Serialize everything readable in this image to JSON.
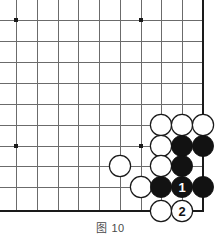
{
  "figure": {
    "caption": "图 10",
    "type": "go-board-diagram"
  },
  "board": {
    "line_color": "#6b6b6b",
    "edge_color": "#1a1a1a",
    "background": "#ffffff",
    "black_stone_color": "#121212",
    "white_stone_color": "#ffffff",
    "white_stone_border": "#1a1a1a",
    "grid_spacing": 20.7,
    "columns_x": [
      16,
      37,
      58,
      78,
      99,
      120,
      141,
      161,
      182,
      203
    ],
    "rows_y": [
      20,
      41,
      62,
      83,
      104,
      125,
      146,
      166,
      187,
      211
    ],
    "edges": {
      "right_x": 203,
      "bottom_y": 211
    },
    "star_points": [
      {
        "x": 16,
        "y": 20
      },
      {
        "x": 141,
        "y": 20
      },
      {
        "x": 16,
        "y": 146
      },
      {
        "x": 141,
        "y": 146
      }
    ],
    "stones": [
      {
        "color": "white",
        "x": 161,
        "y": 125,
        "label": ""
      },
      {
        "color": "white",
        "x": 182,
        "y": 125,
        "label": ""
      },
      {
        "color": "white",
        "x": 203,
        "y": 125,
        "label": ""
      },
      {
        "color": "white",
        "x": 161,
        "y": 146,
        "label": ""
      },
      {
        "color": "black",
        "x": 182,
        "y": 146,
        "label": ""
      },
      {
        "color": "black",
        "x": 203,
        "y": 146,
        "label": ""
      },
      {
        "color": "white",
        "x": 120,
        "y": 166,
        "label": ""
      },
      {
        "color": "white",
        "x": 161,
        "y": 166,
        "label": ""
      },
      {
        "color": "black",
        "x": 182,
        "y": 166,
        "label": ""
      },
      {
        "color": "white",
        "x": 141,
        "y": 187,
        "label": ""
      },
      {
        "color": "black",
        "x": 161,
        "y": 187,
        "label": ""
      },
      {
        "color": "black",
        "x": 182,
        "y": 187,
        "label": "1"
      },
      {
        "color": "black",
        "x": 203,
        "y": 187,
        "label": ""
      },
      {
        "color": "white",
        "x": 161,
        "y": 211,
        "label": ""
      },
      {
        "color": "white",
        "x": 182,
        "y": 211,
        "label": "2"
      }
    ],
    "move_numbers": [
      {
        "number": "1",
        "player": "black"
      },
      {
        "number": "2",
        "player": "white"
      }
    ]
  }
}
